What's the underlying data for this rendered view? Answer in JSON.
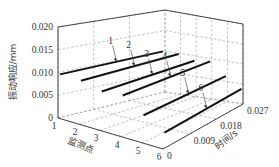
{
  "chart_data": {
    "type": "line",
    "projection": "3d",
    "title": "",
    "xlabel": "监测点",
    "ylabel": "时间/s",
    "zlabel": "振动响应/mm",
    "x_ticks": [
      "1",
      "2",
      "3",
      "4",
      "5",
      "6"
    ],
    "y_ticks": [
      "0",
      "0.009",
      "0.018",
      "0.027"
    ],
    "z_ticks": [
      "0",
      "0.005",
      "0.010",
      "0.015",
      "0.020"
    ],
    "xlim": [
      1,
      6
    ],
    "ylim": [
      0,
      0.027
    ],
    "zlim": [
      0,
      0.02
    ],
    "grid": true,
    "series": [
      {
        "name": "1",
        "monitor_point": 1,
        "t": [
          0.0,
          0.027
        ],
        "values": [
          0.0095,
          0.01
        ]
      },
      {
        "name": "2",
        "monitor_point": 2,
        "t": [
          0.0,
          0.027
        ],
        "values": [
          0.0095,
          0.01
        ]
      },
      {
        "name": "3",
        "monitor_point": 3,
        "t": [
          0.0,
          0.027
        ],
        "values": [
          0.0085,
          0.009
        ]
      },
      {
        "name": "4",
        "monitor_point": 4,
        "t": [
          0.0,
          0.027
        ],
        "values": [
          0.009,
          0.0095
        ]
      },
      {
        "name": "5",
        "monitor_point": 5,
        "t": [
          0.0,
          0.027
        ],
        "values": [
          0.006,
          0.0065
        ]
      },
      {
        "name": "6",
        "monitor_point": 6,
        "t": [
          0.0,
          0.027
        ],
        "values": [
          0.0035,
          0.004
        ]
      }
    ]
  }
}
